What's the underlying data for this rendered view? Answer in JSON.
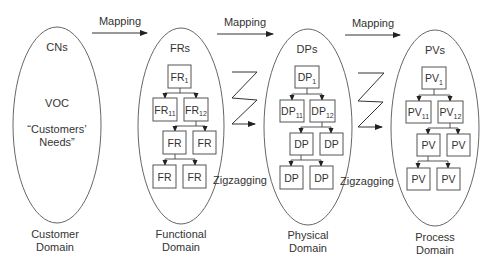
{
  "diagram": {
    "type": "axiomatic-design-domains",
    "mappings": [
      {
        "label": "Mapping",
        "from": "Customer Domain",
        "to": "Functional Domain"
      },
      {
        "label": "Mapping",
        "from": "Functional Domain",
        "to": "Physical Domain"
      },
      {
        "label": "Mapping",
        "from": "Physical Domain",
        "to": "Process Domain"
      }
    ],
    "zigzag_labels": [
      "Zigzagging",
      "Zigzagging"
    ],
    "domains": [
      {
        "title": "CNs",
        "body_lines": [
          "VOC",
          "“Customers’",
          "Needs”"
        ],
        "name_line1": "Customer",
        "name_line2": "Domain"
      },
      {
        "title": "FRs",
        "prefix": "FR",
        "root": {
          "text": "FR",
          "sub": "1"
        },
        "level2": [
          {
            "text": "FR",
            "sub": "11"
          },
          {
            "text": "FR",
            "sub": "12"
          }
        ],
        "level3": [
          "FR",
          "FR"
        ],
        "level4": [
          "FR",
          "FR"
        ],
        "name_line1": "Functional",
        "name_line2": "Domain"
      },
      {
        "title": "DPs",
        "prefix": "DP",
        "root": {
          "text": "DP",
          "sub": "1"
        },
        "level2": [
          {
            "text": "DP",
            "sub": "11"
          },
          {
            "text": "DP",
            "sub": "12"
          }
        ],
        "level3": [
          "DP",
          "DP"
        ],
        "level4": [
          "DP",
          "DP"
        ],
        "name_line1": "Physical",
        "name_line2": "Domain"
      },
      {
        "title": "PVs",
        "prefix": "PV",
        "root": {
          "text": "PV",
          "sub": "1"
        },
        "level2": [
          {
            "text": "PV",
            "sub": "11"
          },
          {
            "text": "PV",
            "sub": "12"
          }
        ],
        "level3": [
          "PV",
          "PV"
        ],
        "level4": [
          "PV",
          "PV"
        ],
        "name_line1": "Process",
        "name_line2": "Domain"
      }
    ]
  }
}
